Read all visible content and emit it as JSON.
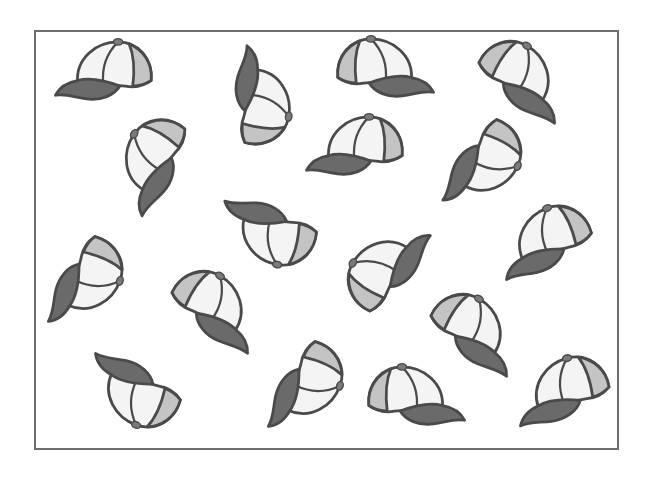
{
  "scene": {
    "description": "Picture of 18 baseball caps scattered in various orientations inside a rectangular frame",
    "frame": {
      "x": 34,
      "y": 30,
      "width": 585,
      "height": 420,
      "border_color": "#6e6e6e"
    },
    "colors": {
      "outline": "#4a4a4a",
      "crown": "#f4f4f4",
      "side_panel": "#c4c4c4",
      "brim": "#6a6a6a",
      "button": "#7a7a7a"
    },
    "caps": [
      {
        "id": 1,
        "cx": 107,
        "cy": 75,
        "rot": 0,
        "flip": false
      },
      {
        "id": 2,
        "cx": 258,
        "cy": 100,
        "rot": 100,
        "flip": false
      },
      {
        "id": 3,
        "cx": 382,
        "cy": 72,
        "rot": 0,
        "flip": true
      },
      {
        "id": 4,
        "cx": 520,
        "cy": 80,
        "rot": 30,
        "flip": true
      },
      {
        "id": 5,
        "cx": 155,
        "cy": 162,
        "rot": -55,
        "flip": false
      },
      {
        "id": 6,
        "cx": 358,
        "cy": 150,
        "rot": 0,
        "flip": false
      },
      {
        "id": 7,
        "cx": 483,
        "cy": 162,
        "rot": 115,
        "flip": true
      },
      {
        "id": 8,
        "cx": 272,
        "cy": 230,
        "rot": 190,
        "flip": true
      },
      {
        "id": 9,
        "cx": 85,
        "cy": 280,
        "rot": 110,
        "flip": true
      },
      {
        "id": 10,
        "cx": 387,
        "cy": 270,
        "rot": -60,
        "flip": true
      },
      {
        "id": 11,
        "cx": 548,
        "cy": 243,
        "rot": -20,
        "flip": false
      },
      {
        "id": 12,
        "cx": 213,
        "cy": 310,
        "rot": 30,
        "flip": true
      },
      {
        "id": 13,
        "cx": 472,
        "cy": 333,
        "rot": 30,
        "flip": true
      },
      {
        "id": 14,
        "cx": 137,
        "cy": 390,
        "rot": 200,
        "flip": true
      },
      {
        "id": 15,
        "cx": 305,
        "cy": 385,
        "rot": 110,
        "flip": true
      },
      {
        "id": 16,
        "cx": 413,
        "cy": 400,
        "rot": 0,
        "flip": true
      },
      {
        "id": 17,
        "cx": 565,
        "cy": 393,
        "rot": -15,
        "flip": false
      },
      {
        "id": 18,
        "cx": 60,
        "cy": 55,
        "rot": 0,
        "flip": false,
        "hidden": true
      }
    ]
  }
}
